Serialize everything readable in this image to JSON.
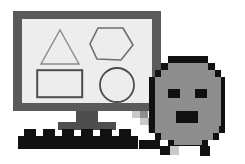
{
  "illustration": {
    "title": "Computer monitor with geometric shapes and pixel character",
    "style": "grayscale clipart",
    "background_color": "#ffffff"
  },
  "monitor": {
    "name": "desktop-monitor",
    "bezel_color": "#5a5a5a",
    "screen_color": "#ededed",
    "stand_color": "#4e4e4e",
    "screen_shapes": [
      {
        "id": "triangle",
        "label": "Triangle",
        "stroke": "#8a8a8a",
        "stroke_width": 1.4
      },
      {
        "id": "hexagon",
        "label": "Hexagon",
        "stroke": "#6e6e6e",
        "stroke_width": 1.6
      },
      {
        "id": "rectangle",
        "label": "Rectangle",
        "stroke": "#4d4d4d",
        "stroke_width": 2.0
      },
      {
        "id": "circle",
        "label": "Circle",
        "stroke": "#4d4d4d",
        "stroke_width": 1.8
      }
    ]
  },
  "keyboard": {
    "name": "keyboard",
    "color": "#111111",
    "key_count": 6
  },
  "character": {
    "name": "pixel-blob-character",
    "outline_color": "#111111",
    "body_color": "#8e8e8e",
    "feature_color": "#111111",
    "features": [
      {
        "id": "left-eye",
        "label": "Left eye"
      },
      {
        "id": "right-eye",
        "label": "Right eye"
      },
      {
        "id": "mouth",
        "label": "Open mouth"
      }
    ]
  },
  "cursor_trail": {
    "name": "pixel-arm-trail",
    "colors": [
      "#111111",
      "#8e8e8e",
      "#c9c9c9",
      "#ffffff"
    ]
  }
}
